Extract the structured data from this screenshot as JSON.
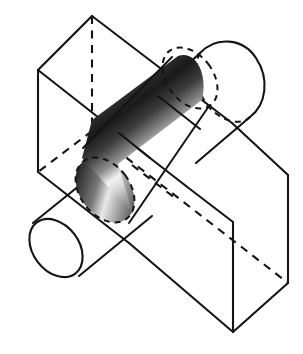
{
  "figure": {
    "title": "Intersection of a rectangular prism and a cylinder",
    "caption": "",
    "label": "",
    "background_color": "#ffffff",
    "line_color": "#141414",
    "shading": {
      "name": "cylinder-metallic-gradient",
      "stops": [
        {
          "offset": "0%",
          "color": "#5c5c5c"
        },
        {
          "offset": "8%",
          "color": "#2e2e2e"
        },
        {
          "offset": "20%",
          "color": "#1a1a1a"
        },
        {
          "offset": "34%",
          "color": "#3d3d3d"
        },
        {
          "offset": "48%",
          "color": "#8f8f8f"
        },
        {
          "offset": "58%",
          "color": "#f2f2f2"
        },
        {
          "offset": "66%",
          "color": "#d8d8d8"
        },
        {
          "offset": "78%",
          "color": "#9a9a9a"
        },
        {
          "offset": "88%",
          "color": "#6b6b6b"
        },
        {
          "offset": "96%",
          "color": "#3a3a3a"
        },
        {
          "offset": "100%",
          "color": "#2a2a2a"
        }
      ]
    },
    "cap_shading": {
      "name": "cylinder-cap-gradient",
      "stops": [
        {
          "offset": "0%",
          "color": "#4a4a4a"
        },
        {
          "offset": "25%",
          "color": "#1d1d1d"
        },
        {
          "offset": "52%",
          "color": "#787878"
        },
        {
          "offset": "66%",
          "color": "#e8e8e8"
        },
        {
          "offset": "82%",
          "color": "#a0a0a0"
        },
        {
          "offset": "100%",
          "color": "#4f4f4f"
        }
      ]
    },
    "parts": [
      {
        "id": "box",
        "name": "rectangular-prism",
        "style": "wireframe with hidden dashed edges"
      },
      {
        "id": "cylinder",
        "name": "cylinder",
        "style": "wireframe outside the box"
      },
      {
        "id": "intersection",
        "name": "intersection-solid",
        "style": "gradient shaded"
      },
      {
        "id": "cap-near",
        "name": "near-cross-section",
        "style": "dashed ellipse"
      },
      {
        "id": "cap-far",
        "name": "far-cross-section",
        "style": "dashed ellipse"
      },
      {
        "id": "cyl-end-lower",
        "name": "lower-left-end-cap",
        "style": "solid ellipse"
      },
      {
        "id": "cyl-end-upper",
        "name": "upper-right-end-cap",
        "style": "solid arc with dashed back arc"
      }
    ]
  }
}
